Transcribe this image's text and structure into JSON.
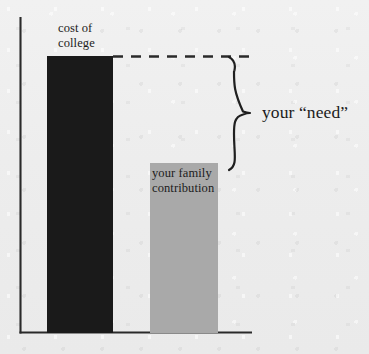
{
  "chart_data": {
    "type": "bar",
    "title": "",
    "xlabel": "",
    "ylabel": "",
    "grid": false,
    "legend_position": "none",
    "axis_ranges": {
      "y": [
        0,
        100
      ]
    },
    "categories": [
      "cost of college",
      "your family contribution"
    ],
    "values": [
      100,
      62
    ],
    "bar_colors": [
      "#1a1a1a",
      "#a9a9a9"
    ],
    "annotations": [
      {
        "name": "cost-of-college",
        "text": "cost of\ncollege",
        "target": "bar-cost-of-college",
        "position": "above-bar"
      },
      {
        "name": "your-family-contribution",
        "text": "your family\ncontribution",
        "target": "bar-family-contribution",
        "position": "inside-bar-top"
      },
      {
        "name": "your-need",
        "text": "your “need”",
        "target": "gap-between-bar-tops",
        "position": "right-of-brace",
        "marker": "curly-brace"
      },
      {
        "name": "cost-level-guide",
        "text": "",
        "style": "dashed-line",
        "from": "top-of-cost-of-college-bar",
        "to": "brace-top"
      }
    ]
  },
  "labels": {
    "cost_of_college": "cost of\ncollege",
    "family_contribution": "your family\ncontribution",
    "your_need": "your “need”"
  },
  "colors": {
    "background": "#efefef",
    "ink": "#1c1c1c",
    "cost_bar": "#1a1a1a",
    "contribution_bar": "#a9a9a9",
    "axis": "#2a2a2a",
    "dashed_line": "#2a2a2a",
    "brace": "#1f1f1f"
  },
  "geometry": {
    "axis_origin": {
      "x": 20,
      "y": 333
    },
    "y_axis_top": 17,
    "x_axis_right": 252,
    "cost_bar": {
      "x": 47,
      "y": 56,
      "width": 66,
      "height": 277
    },
    "contribution_bar": {
      "x": 150,
      "y": 163,
      "width": 68,
      "height": 170
    },
    "dashed_line": {
      "x1": 113,
      "x2": 253,
      "y": 56
    },
    "brace": {
      "top": 57,
      "bottom": 170,
      "tip_x": 250,
      "tip_y": 113,
      "spine_x": 232
    }
  }
}
